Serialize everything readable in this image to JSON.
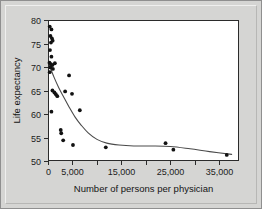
{
  "figure": {
    "background_color": "#d5d5d3",
    "plot_background_color": "#ffffff",
    "frame_color": "#2b2b2b"
  },
  "chart_data": {
    "type": "scatter",
    "title": "",
    "subtitle": "",
    "xlabel": "Number of persons per physician",
    "ylabel": "Life expectancy",
    "xlim": [
      0,
      39000
    ],
    "ylim": [
      50,
      80
    ],
    "grid": false,
    "legend": null,
    "x_major_ticks": [
      0,
      5000,
      15000,
      25000,
      35000
    ],
    "x_major_tick_labels": [
      "0",
      "5,000",
      "15,000",
      "25,000",
      "35,000"
    ],
    "x_minor_ticks": [
      10000,
      20000,
      30000
    ],
    "y_ticks": [
      50,
      55,
      60,
      65,
      70,
      75,
      80
    ],
    "y_tick_labels": [
      "50",
      "55",
      "60",
      "65",
      "70",
      "75",
      "80"
    ],
    "marker_color": "#121212",
    "marker_shape": "circle",
    "points": [
      {
        "x": 350,
        "y": 78.6
      },
      {
        "x": 700,
        "y": 78.0
      },
      {
        "x": 500,
        "y": 76.6
      },
      {
        "x": 800,
        "y": 76.1
      },
      {
        "x": 950,
        "y": 75.6
      },
      {
        "x": 600,
        "y": 75.2
      },
      {
        "x": 400,
        "y": 73.6
      },
      {
        "x": 700,
        "y": 72.2
      },
      {
        "x": 300,
        "y": 70.9
      },
      {
        "x": 600,
        "y": 70.6
      },
      {
        "x": 900,
        "y": 70.4
      },
      {
        "x": 1400,
        "y": 70.8
      },
      {
        "x": 500,
        "y": 69.9
      },
      {
        "x": 1000,
        "y": 69.6
      },
      {
        "x": 350,
        "y": 68.9
      },
      {
        "x": 4300,
        "y": 68.2
      },
      {
        "x": 900,
        "y": 65.0
      },
      {
        "x": 1300,
        "y": 64.6
      },
      {
        "x": 1600,
        "y": 64.2
      },
      {
        "x": 1900,
        "y": 63.8
      },
      {
        "x": 3500,
        "y": 64.8
      },
      {
        "x": 4900,
        "y": 64.3
      },
      {
        "x": 6500,
        "y": 60.8
      },
      {
        "x": 700,
        "y": 60.5
      },
      {
        "x": 2600,
        "y": 56.6
      },
      {
        "x": 2700,
        "y": 55.9
      },
      {
        "x": 3100,
        "y": 54.4
      },
      {
        "x": 5100,
        "y": 53.4
      },
      {
        "x": 11800,
        "y": 52.9
      },
      {
        "x": 24000,
        "y": 53.8
      },
      {
        "x": 25600,
        "y": 52.4
      },
      {
        "x": 36500,
        "y": 51.3
      }
    ],
    "trend_curve": {
      "style": "smooth-decay",
      "color": "#4a4a4a",
      "points": [
        {
          "x": 300,
          "y": 70.3
        },
        {
          "x": 1200,
          "y": 67.9
        },
        {
          "x": 2200,
          "y": 65.6
        },
        {
          "x": 3200,
          "y": 63.6
        },
        {
          "x": 4300,
          "y": 61.5
        },
        {
          "x": 5500,
          "y": 59.4
        },
        {
          "x": 6800,
          "y": 57.6
        },
        {
          "x": 8200,
          "y": 56.0
        },
        {
          "x": 10000,
          "y": 54.6
        },
        {
          "x": 12000,
          "y": 53.8
        },
        {
          "x": 14500,
          "y": 53.4
        },
        {
          "x": 17500,
          "y": 53.2
        },
        {
          "x": 21000,
          "y": 53.2
        },
        {
          "x": 25000,
          "y": 53.1
        },
        {
          "x": 29000,
          "y": 52.6
        },
        {
          "x": 33000,
          "y": 52.0
        },
        {
          "x": 37500,
          "y": 51.4
        }
      ]
    }
  }
}
